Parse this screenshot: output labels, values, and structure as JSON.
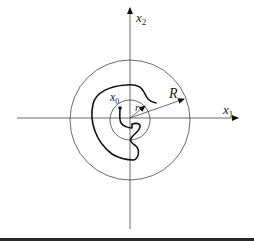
{
  "diagram": {
    "axes": {
      "x_label": "x",
      "x_sub": "1",
      "y_label": "x",
      "y_sub": "2"
    },
    "point_label": "x",
    "point_sub": "0",
    "inner_radius_label": "r",
    "outer_radius_label": "R"
  },
  "colors": {
    "line": "#333333",
    "curve": "#111111",
    "footer_bar": "#2a2a2a"
  }
}
